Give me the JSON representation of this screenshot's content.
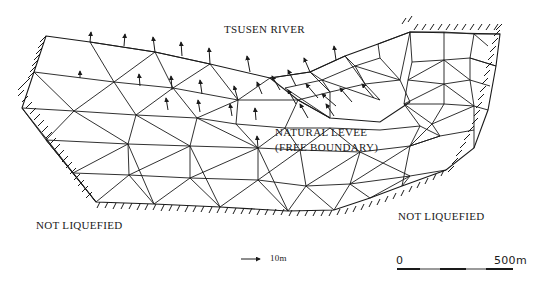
{
  "figure": {
    "type": "finite-element-mesh",
    "colors": {
      "line": "#1a1a1a",
      "background": "#ffffff"
    }
  },
  "labels": {
    "river": "TSUSEN RIVER",
    "levee_line1": "NATURAL LEVEE",
    "levee_line2": "(FREE BOUNDARY)",
    "not_liquefied_left": "NOT LIQUEFIED",
    "not_liquefied_right": "NOT LIQUEFIED"
  },
  "vector_scale": {
    "label": "10m"
  },
  "distance_scale": {
    "start": "0",
    "end": "500m"
  }
}
